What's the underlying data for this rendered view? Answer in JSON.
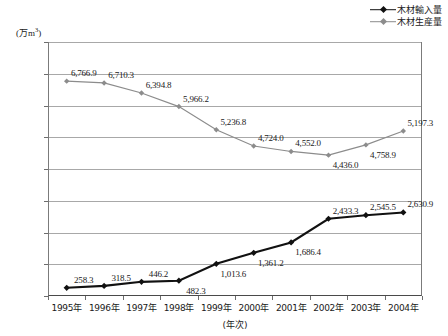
{
  "chart_data": {
    "type": "line",
    "title": "",
    "xlabel": "(年次)",
    "ylabel": "(万m3)",
    "y_unit_text": "(万m",
    "y_unit_sup": "3",
    "y_unit_tail": ")",
    "categories": [
      "1995年",
      "1996年",
      "1997年",
      "1998年",
      "1999年",
      "2000年",
      "2001年",
      "2002年",
      "2003年",
      "2004年"
    ],
    "ylim": [
      0,
      8000
    ],
    "yticks": [
      0,
      1000,
      2000,
      3000,
      4000,
      5000,
      6000,
      7000,
      8000
    ],
    "ytick_labels": [
      "0",
      "1,000",
      "2,000",
      "3,000",
      "4,000",
      "5,000",
      "6,000",
      "7,000",
      "8,000"
    ],
    "grid": true,
    "legend_position": "top-right",
    "series": [
      {
        "name": "木材輸入量",
        "color": "#111111",
        "marker": "diamond",
        "values": [
          258.3,
          318.5,
          446.2,
          482.3,
          1013.6,
          1361.2,
          1686.4,
          2433.3,
          2545.5,
          2630.9
        ],
        "labels": [
          "258.3",
          "318.5",
          "446.2",
          "482.3",
          "1,013.6",
          "1,361.2",
          "1,686.4",
          "2,433.3",
          "2,545.5",
          "2,630.9"
        ],
        "label_positions": [
          "above",
          "above",
          "above",
          "below",
          "below",
          "below",
          "below",
          "above",
          "above",
          "above"
        ]
      },
      {
        "name": "木材生産量",
        "color": "#8c8c8c",
        "marker": "diamond",
        "values": [
          6766.9,
          6710.3,
          6394.8,
          5966.2,
          5236.8,
          4724.0,
          4552.0,
          4436.0,
          4758.9,
          5197.3
        ],
        "labels": [
          "6,766.9",
          "6,710.3",
          "6,394.8",
          "5,966.2",
          "5,236.8",
          "4,724.0",
          "4,552.0",
          "4,436.0",
          "4,758.9",
          "5,197.3"
        ],
        "label_positions": [
          "above",
          "above",
          "above",
          "above",
          "above",
          "above",
          "above",
          "below",
          "below",
          "above"
        ]
      }
    ],
    "colors": {
      "import_line": "#111111",
      "production_line": "#8c8c8c",
      "gridline": "#a8a8a8",
      "axis": "#4a4a4a",
      "background": "#ffffff",
      "text": "#1a1a1a"
    }
  }
}
